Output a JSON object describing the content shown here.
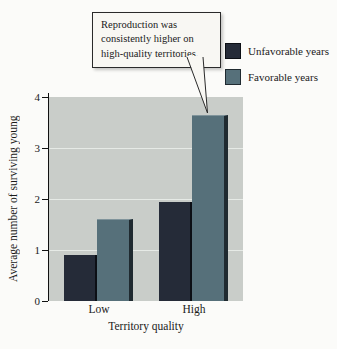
{
  "page": {
    "background": "#fbfbf9"
  },
  "chart_data": {
    "type": "bar",
    "title": "",
    "categories": [
      "Low",
      "High"
    ],
    "series": [
      {
        "name": "Unfavorable years",
        "color": "#252b38",
        "edge_color": "#0c0f15",
        "values": [
          0.9,
          1.95
        ]
      },
      {
        "name": "Favorable years",
        "color": "#56707a",
        "edge_color": "#1f2a30",
        "values": [
          1.6,
          3.65
        ]
      }
    ],
    "xlabel": "Territory quality",
    "ylabel": "Average number of surviving young",
    "ylim": [
      0,
      4
    ],
    "yticks": [
      0,
      1,
      2,
      3,
      4
    ],
    "gridlines": [
      1,
      2,
      3
    ],
    "grid_on": true,
    "legend_position": "top-right",
    "plot_background": "#c9cdc9",
    "gridline_color": "#e6eae6",
    "annotation": "Reproduction was consistently higher on high-quality territories.",
    "annotation_points_to": "Favorable-years bar of High territory quality"
  }
}
